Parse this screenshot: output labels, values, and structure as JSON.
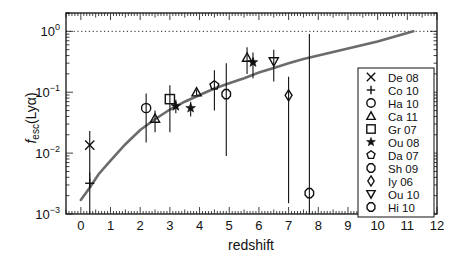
{
  "chart_data": {
    "type": "scatter",
    "title": "",
    "xlabel": "redshift",
    "ylabel": "f_esc(Lyα)",
    "ylabel_main": "f",
    "ylabel_sub": "esc",
    "ylabel_rest": "(Lyα)",
    "xlim": [
      -0.5,
      12
    ],
    "ylim": [
      0.001,
      2
    ],
    "yscale": "log",
    "grid": false,
    "x_ticks": [
      0,
      1,
      2,
      3,
      4,
      5,
      6,
      7,
      8,
      9,
      10,
      11,
      12
    ],
    "y_ticks": [
      {
        "value": 0.001,
        "base": "10",
        "exp": "−3"
      },
      {
        "value": 0.01,
        "base": "10",
        "exp": "−2"
      },
      {
        "value": 0.1,
        "base": "10",
        "exp": "−1"
      },
      {
        "value": 1,
        "base": "10",
        "exp": "0"
      }
    ],
    "reference_line": {
      "y": 1,
      "style": "dotted"
    },
    "fit_curve": {
      "color": "#6b6b6b",
      "points": [
        [
          0,
          0.0017
        ],
        [
          0.3,
          0.0027
        ],
        [
          0.6,
          0.0045
        ],
        [
          1,
          0.0075
        ],
        [
          1.5,
          0.014
        ],
        [
          2,
          0.024
        ],
        [
          2.5,
          0.036
        ],
        [
          3,
          0.052
        ],
        [
          3.5,
          0.07
        ],
        [
          4,
          0.09
        ],
        [
          4.5,
          0.115
        ],
        [
          5,
          0.14
        ],
        [
          5.5,
          0.17
        ],
        [
          6,
          0.21
        ],
        [
          6.5,
          0.25
        ],
        [
          7,
          0.3
        ],
        [
          7.5,
          0.35
        ],
        [
          8,
          0.4
        ],
        [
          9,
          0.52
        ],
        [
          10,
          0.68
        ],
        [
          11.2,
          1.0
        ]
      ]
    },
    "legend_position": "right-inside",
    "series": [
      {
        "name": "De 08",
        "marker": "x",
        "points": [
          {
            "x": 0.3,
            "y": 0.0135,
            "ylo": 0.0035,
            "yhi": 0.023
          }
        ]
      },
      {
        "name": "Co 10",
        "marker": "plus",
        "points": [
          {
            "x": 0.3,
            "y": 0.0032,
            "ylo": 0.001,
            "yhi": 0.0048
          }
        ]
      },
      {
        "name": "Ha 10",
        "marker": "circle",
        "points": [
          {
            "x": 2.2,
            "y": 0.055,
            "ylo": 0.015,
            "yhi": 0.095
          }
        ]
      },
      {
        "name": "Ca 11",
        "marker": "triangle-up",
        "points": [
          {
            "x": 2.5,
            "y": 0.037,
            "ylo": 0.022,
            "yhi": 0.05
          },
          {
            "x": 3.9,
            "y": 0.1,
            "ylo": 0.09,
            "yhi": 0.11
          },
          {
            "x": 5.6,
            "y": 0.37,
            "ylo": 0.2,
            "yhi": 0.55
          }
        ]
      },
      {
        "name": "Gr 07",
        "marker": "square",
        "points": [
          {
            "x": 3.0,
            "y": 0.077,
            "ylo": 0.022,
            "yhi": 0.13
          }
        ]
      },
      {
        "name": "Ou 08",
        "marker": "star",
        "points": [
          {
            "x": 3.2,
            "y": 0.059,
            "ylo": 0.045,
            "yhi": 0.075
          },
          {
            "x": 3.7,
            "y": 0.055,
            "ylo": 0.04,
            "yhi": 0.07
          },
          {
            "x": 5.8,
            "y": 0.31,
            "ylo": 0.17,
            "yhi": 0.45
          }
        ]
      },
      {
        "name": "Da 07",
        "marker": "pentagon",
        "points": [
          {
            "x": 4.5,
            "y": 0.13,
            "ylo": 0.05,
            "yhi": 0.23
          }
        ]
      },
      {
        "name": "Sh 09",
        "marker": "octagon",
        "points": [
          {
            "x": 4.9,
            "y": 0.093,
            "ylo": 0.009,
            "yhi": 0.3
          }
        ]
      },
      {
        "name": "Iy 06",
        "marker": "diamond",
        "points": [
          {
            "x": 7.0,
            "y": 0.089,
            "ylo": 0.0015,
            "yhi": 0.18
          }
        ]
      },
      {
        "name": "Ou 10",
        "marker": "triangle-down",
        "points": [
          {
            "x": 6.5,
            "y": 0.32,
            "ylo": 0.15,
            "yhi": 0.5
          }
        ]
      },
      {
        "name": "Hi 10",
        "marker": "octagon",
        "points": [
          {
            "x": 7.7,
            "y": 0.0022,
            "ylo": 0.001,
            "yhi": 0.9
          }
        ]
      }
    ]
  }
}
